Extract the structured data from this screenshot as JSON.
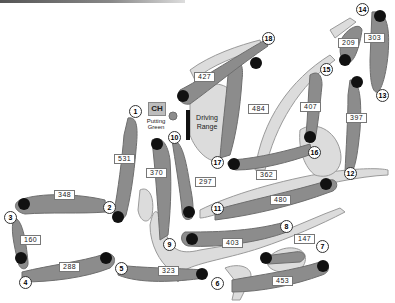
{
  "map": {
    "type": "golf-course-layout",
    "colors": {
      "fairway": "#8c8c8c",
      "rough": "#dcdcdc",
      "green": "#111111",
      "background": "#ffffff"
    },
    "landmarks": {
      "clubhouse": "CH",
      "putting_green": "Putting Green",
      "driving_range": "Driving Range"
    },
    "holes": [
      {
        "number": "1",
        "yardage": "531"
      },
      {
        "number": "2",
        "yardage": "348"
      },
      {
        "number": "3",
        "yardage": "160"
      },
      {
        "number": "4",
        "yardage": "288"
      },
      {
        "number": "5",
        "yardage": "323"
      },
      {
        "number": "6",
        "yardage": "453"
      },
      {
        "number": "7",
        "yardage": "147"
      },
      {
        "number": "8",
        "yardage": "403"
      },
      {
        "number": "9",
        "yardage": "370"
      },
      {
        "number": "10",
        "yardage": "297"
      },
      {
        "number": "11",
        "yardage": "480"
      },
      {
        "number": "12",
        "yardage": "397"
      },
      {
        "number": "13",
        "yardage": "303"
      },
      {
        "number": "14",
        "yardage": "209"
      },
      {
        "number": "15",
        "yardage": "407"
      },
      {
        "number": "16",
        "yardage": "362"
      },
      {
        "number": "17",
        "yardage": "484"
      },
      {
        "number": "18",
        "yardage": "427"
      }
    ]
  }
}
